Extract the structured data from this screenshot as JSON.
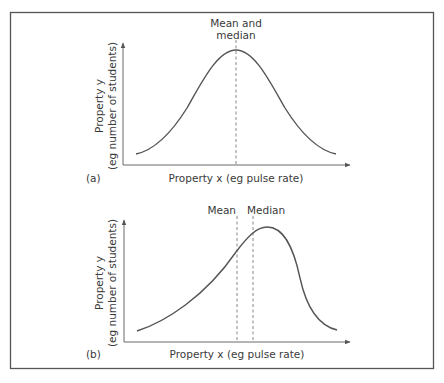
{
  "panels": [
    {
      "id": "a",
      "panel_label": "(a)",
      "y_axis_label_line1": "Property y",
      "y_axis_label_line2": "(eg number of students)",
      "x_axis_label": "Property x (eg pulse rate)",
      "marker_label_line1": "Mean and",
      "marker_label_line2": "median",
      "distribution": "symmetric (normal)"
    },
    {
      "id": "b",
      "panel_label": "(b)",
      "y_axis_label_line1": "Property y",
      "y_axis_label_line2": "(eg number of students)",
      "x_axis_label": "Property x (eg pulse rate)",
      "mean_label": "Mean",
      "median_label": "Median",
      "distribution": "negatively skewed"
    }
  ],
  "colors": {
    "curve": "#555555",
    "axis": "#6a6a6a",
    "dashed_marker": "#888888",
    "frame": "#555555",
    "text": "#3a3a3a"
  }
}
